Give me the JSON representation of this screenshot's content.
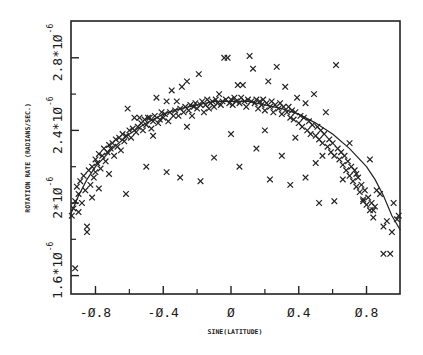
{
  "chart_data": {
    "type": "scatter",
    "title": "",
    "xlabel": "SINE(LATITUDE)",
    "ylabel": "ROTATION RATE (RADIANS/SEC.)",
    "xlim": [
      -0.95,
      1.0
    ],
    "ylim": [
      1.5e-06,
      3e-06
    ],
    "grid": false,
    "legend": null,
    "x_ticks": [
      {
        "value": -0.8,
        "label": "-0.8"
      },
      {
        "value": -0.4,
        "label": "-0.4"
      },
      {
        "value": 0,
        "label": "0"
      },
      {
        "value": 0.4,
        "label": "0.4"
      },
      {
        "value": 0.8,
        "label": "0.8"
      }
    ],
    "x_minor_ticks": [
      -0.6,
      -0.2,
      0.2,
      0.6
    ],
    "y_ticks": [
      {
        "value": 1.6e-06,
        "mantissa": "1.6*10",
        "exponent": "-6"
      },
      {
        "value": 2e-06,
        "mantissa": "2*10",
        "exponent": "-6"
      },
      {
        "value": 2.4e-06,
        "mantissa": "2.4*10",
        "exponent": "-6"
      },
      {
        "value": 2.8e-06,
        "mantissa": "2.8*10",
        "exponent": "-6"
      }
    ],
    "y_minor_ticks": [
      1.8e-06,
      2.2e-06,
      2.6e-06
    ],
    "series": [
      {
        "name": "observations",
        "marker": "x",
        "points": [
          [
            -0.94,
            1.93
          ],
          [
            -0.93,
            1.97
          ],
          [
            -0.92,
            2.01
          ],
          [
            -0.92,
            1.64
          ],
          [
            -0.91,
            2.09
          ],
          [
            -0.9,
            2.05
          ],
          [
            -0.9,
            1.95
          ],
          [
            -0.89,
            2.12
          ],
          [
            -0.88,
            2.0
          ],
          [
            -0.87,
            2.15
          ],
          [
            -0.86,
            2.07
          ],
          [
            -0.85,
            1.87
          ],
          [
            -0.85,
            1.84
          ],
          [
            -0.84,
            2.18
          ],
          [
            -0.83,
            2.1
          ],
          [
            -0.82,
            2.2
          ],
          [
            -0.82,
            2.03
          ],
          [
            -0.81,
            2.14
          ],
          [
            -0.8,
            2.24
          ],
          [
            -0.8,
            2.17
          ],
          [
            -0.79,
            2.22
          ],
          [
            -0.78,
            2.08
          ],
          [
            -0.78,
            2.27
          ],
          [
            -0.77,
            2.19
          ],
          [
            -0.76,
            2.26
          ],
          [
            -0.75,
            2.3
          ],
          [
            -0.74,
            2.23
          ],
          [
            -0.73,
            2.28
          ],
          [
            -0.72,
            2.32
          ],
          [
            -0.72,
            2.16
          ],
          [
            -0.71,
            2.3
          ],
          [
            -0.7,
            2.33
          ],
          [
            -0.69,
            2.26
          ],
          [
            -0.68,
            2.35
          ],
          [
            -0.67,
            2.31
          ],
          [
            -0.66,
            2.36
          ],
          [
            -0.65,
            2.29
          ],
          [
            -0.64,
            2.38
          ],
          [
            -0.63,
            2.34
          ],
          [
            -0.62,
            2.37
          ],
          [
            -0.61,
            2.52
          ],
          [
            -0.6,
            2.4
          ],
          [
            -0.59,
            2.36
          ],
          [
            -0.58,
            2.41
          ],
          [
            -0.57,
            2.47
          ],
          [
            -0.56,
            2.39
          ],
          [
            -0.55,
            2.42
          ],
          [
            -0.54,
            2.47
          ],
          [
            -0.53,
            2.44
          ],
          [
            -0.52,
            2.4
          ],
          [
            -0.51,
            2.46
          ],
          [
            -0.5,
            2.43
          ],
          [
            -0.49,
            2.47
          ],
          [
            -0.48,
            2.47
          ],
          [
            -0.47,
            2.41
          ],
          [
            -0.46,
            2.45
          ],
          [
            -0.45,
            2.48
          ],
          [
            -0.44,
            2.58
          ],
          [
            -0.43,
            2.44
          ],
          [
            -0.42,
            2.46
          ],
          [
            -0.41,
            2.5
          ],
          [
            -0.4,
            2.47
          ],
          [
            -0.39,
            2.49
          ],
          [
            -0.38,
            2.56
          ],
          [
            -0.37,
            2.45
          ],
          [
            -0.36,
            2.5
          ],
          [
            -0.35,
            2.62
          ],
          [
            -0.34,
            2.48
          ],
          [
            -0.33,
            2.51
          ],
          [
            -0.32,
            2.56
          ],
          [
            -0.31,
            2.48
          ],
          [
            -0.3,
            2.52
          ],
          [
            -0.29,
            2.64
          ],
          [
            -0.28,
            2.5
          ],
          [
            -0.27,
            2.53
          ],
          [
            -0.26,
            2.67
          ],
          [
            -0.25,
            2.51
          ],
          [
            -0.24,
            2.54
          ],
          [
            -0.23,
            2.48
          ],
          [
            -0.22,
            2.53
          ],
          [
            -0.21,
            2.55
          ],
          [
            -0.2,
            2.52
          ],
          [
            -0.19,
            2.71
          ],
          [
            -0.18,
            2.54
          ],
          [
            -0.17,
            2.56
          ],
          [
            -0.16,
            2.5
          ],
          [
            -0.15,
            2.54
          ],
          [
            -0.14,
            2.57
          ],
          [
            -0.13,
            2.52
          ],
          [
            -0.12,
            2.55
          ],
          [
            -0.11,
            2.56
          ],
          [
            -0.1,
            2.53
          ],
          [
            -0.09,
            2.57
          ],
          [
            -0.08,
            2.55
          ],
          [
            -0.07,
            2.6
          ],
          [
            -0.06,
            2.54
          ],
          [
            -0.05,
            2.56
          ],
          [
            -0.04,
            2.8
          ],
          [
            -0.03,
            2.57
          ],
          [
            -0.02,
            2.8
          ],
          [
            -0.01,
            2.55
          ],
          [
            0.0,
            2.57
          ],
          [
            0.01,
            2.54
          ],
          [
            0.02,
            2.58
          ],
          [
            0.03,
            2.56
          ],
          [
            0.04,
            2.65
          ],
          [
            0.05,
            2.55
          ],
          [
            0.06,
            2.58
          ],
          [
            0.07,
            2.65
          ],
          [
            0.08,
            2.56
          ],
          [
            0.09,
            2.53
          ],
          [
            0.1,
            2.57
          ],
          [
            0.11,
            2.81
          ],
          [
            0.12,
            2.56
          ],
          [
            0.13,
            2.74
          ],
          [
            0.14,
            2.55
          ],
          [
            0.15,
            2.57
          ],
          [
            0.16,
            2.52
          ],
          [
            0.17,
            2.56
          ],
          [
            0.18,
            2.54
          ],
          [
            0.19,
            2.57
          ],
          [
            0.2,
            2.51
          ],
          [
            0.21,
            2.55
          ],
          [
            0.22,
            2.67
          ],
          [
            0.23,
            2.53
          ],
          [
            0.24,
            2.56
          ],
          [
            0.25,
            2.5
          ],
          [
            0.26,
            2.54
          ],
          [
            0.27,
            2.75
          ],
          [
            0.28,
            2.52
          ],
          [
            0.29,
            2.55
          ],
          [
            0.3,
            2.49
          ],
          [
            0.31,
            2.53
          ],
          [
            0.32,
            2.64
          ],
          [
            0.33,
            2.5
          ],
          [
            0.34,
            2.53
          ],
          [
            0.35,
            2.47
          ],
          [
            0.36,
            2.51
          ],
          [
            0.37,
            2.46
          ],
          [
            0.38,
            2.5
          ],
          [
            0.39,
            2.58
          ],
          [
            0.4,
            2.44
          ],
          [
            0.41,
            2.48
          ],
          [
            0.42,
            2.42
          ],
          [
            0.43,
            2.47
          ],
          [
            0.44,
            2.55
          ],
          [
            0.45,
            2.4
          ],
          [
            0.46,
            2.45
          ],
          [
            0.47,
            2.38
          ],
          [
            0.48,
            2.43
          ],
          [
            0.49,
            2.6
          ],
          [
            0.5,
            2.37
          ],
          [
            0.51,
            2.42
          ],
          [
            0.52,
            2.35
          ],
          [
            0.53,
            2.4
          ],
          [
            0.54,
            2.33
          ],
          [
            0.55,
            2.38
          ],
          [
            0.56,
            2.5
          ],
          [
            0.57,
            2.31
          ],
          [
            0.58,
            2.35
          ],
          [
            0.59,
            2.28
          ],
          [
            0.6,
            2.33
          ],
          [
            0.61,
            2.26
          ],
          [
            0.62,
            2.76
          ],
          [
            0.63,
            2.3
          ],
          [
            0.64,
            2.24
          ],
          [
            0.65,
            2.28
          ],
          [
            0.66,
            2.21
          ],
          [
            0.67,
            2.26
          ],
          [
            0.68,
            2.18
          ],
          [
            0.69,
            2.23
          ],
          [
            0.7,
            2.15
          ],
          [
            0.71,
            2.2
          ],
          [
            0.72,
            2.12
          ],
          [
            0.73,
            2.18
          ],
          [
            0.74,
            2.09
          ],
          [
            0.75,
            2.14
          ],
          [
            0.76,
            2.06
          ],
          [
            0.77,
            2.1
          ],
          [
            0.78,
            2.02
          ],
          [
            0.79,
            2.07
          ],
          [
            0.8,
            1.99
          ],
          [
            0.81,
            2.03
          ],
          [
            0.82,
            1.96
          ],
          [
            0.83,
            2.0
          ],
          [
            0.84,
            1.92
          ],
          [
            0.85,
            1.98
          ],
          [
            0.86,
            2.07
          ],
          [
            0.88,
            2.05
          ],
          [
            0.9,
            1.87
          ],
          [
            0.92,
            1.9
          ],
          [
            0.95,
            1.84
          ],
          [
            0.98,
            1.91
          ],
          [
            0.99,
            1.93
          ],
          [
            -0.3,
            2.14
          ],
          [
            -0.18,
            2.12
          ],
          [
            -0.62,
            2.05
          ],
          [
            0.23,
            2.13
          ],
          [
            0.44,
            2.14
          ],
          [
            0.61,
            2.01
          ],
          [
            0.78,
            2.01
          ],
          [
            0.35,
            2.1
          ],
          [
            0.52,
            2.0
          ],
          [
            0.84,
            1.96
          ],
          [
            -0.5,
            2.2
          ],
          [
            -0.38,
            2.17
          ],
          [
            -0.1,
            2.25
          ],
          [
            0.05,
            2.2
          ],
          [
            0.15,
            2.3
          ],
          [
            0.3,
            2.26
          ],
          [
            0.54,
            2.26
          ],
          [
            0.66,
            2.13
          ],
          [
            0.74,
            2.16
          ],
          [
            0.9,
            1.72
          ],
          [
            -0.46,
            2.37
          ],
          [
            -0.26,
            2.42
          ],
          [
            0.0,
            2.38
          ],
          [
            0.2,
            2.4
          ],
          [
            0.38,
            2.36
          ],
          [
            0.5,
            2.22
          ],
          [
            0.7,
            2.33
          ],
          [
            0.82,
            2.24
          ],
          [
            0.96,
            2.0
          ],
          [
            0.94,
            1.72
          ]
        ]
      }
    ],
    "fit_curve": {
      "name": "fitted curve",
      "points": [
        [
          -0.95,
          1.93
        ],
        [
          -0.9,
          2.04
        ],
        [
          -0.85,
          2.13
        ],
        [
          -0.8,
          2.2
        ],
        [
          -0.7,
          2.3
        ],
        [
          -0.6,
          2.38
        ],
        [
          -0.5,
          2.44
        ],
        [
          -0.4,
          2.49
        ],
        [
          -0.3,
          2.52
        ],
        [
          -0.2,
          2.54
        ],
        [
          -0.1,
          2.56
        ],
        [
          0.0,
          2.56
        ],
        [
          0.1,
          2.56
        ],
        [
          0.2,
          2.54
        ],
        [
          0.3,
          2.52
        ],
        [
          0.4,
          2.49
        ],
        [
          0.5,
          2.44
        ],
        [
          0.6,
          2.38
        ],
        [
          0.7,
          2.3
        ],
        [
          0.8,
          2.2
        ],
        [
          0.85,
          2.13
        ],
        [
          0.9,
          2.04
        ],
        [
          0.95,
          1.93
        ],
        [
          1.0,
          1.85
        ]
      ]
    }
  }
}
